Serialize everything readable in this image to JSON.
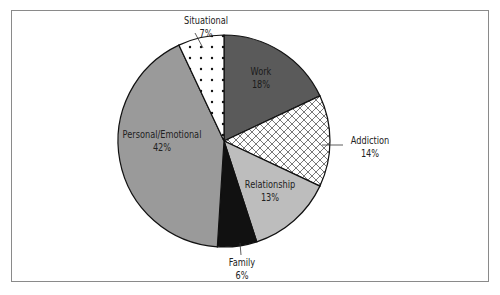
{
  "chart_data": {
    "type": "pie",
    "title": "",
    "slices": [
      {
        "label": "Work",
        "value": 18,
        "display": "18%",
        "fill": "#5a5a5a",
        "pattern": "solid"
      },
      {
        "label": "Addiction",
        "value": 14,
        "display": "14%",
        "fill": "#ffffff",
        "pattern": "crosshatch"
      },
      {
        "label": "Relationship",
        "value": 13,
        "display": "13%",
        "fill": "#bdbdbd",
        "pattern": "solid"
      },
      {
        "label": "Family",
        "value": 6,
        "display": "6%",
        "fill": "#111111",
        "pattern": "solid"
      },
      {
        "label": "Personal/Emotional",
        "value": 42,
        "display": "42%",
        "fill": "#9a9a9a",
        "pattern": "solid"
      },
      {
        "label": "Situational",
        "value": 7,
        "display": "7%",
        "fill": "#ffffff",
        "pattern": "dots"
      }
    ],
    "start_angle_deg": 0,
    "direction": "clockwise",
    "legend": "none",
    "labels_position": "inside/leader-lines"
  },
  "labels": {
    "work": {
      "name": "Work",
      "pct": "18%"
    },
    "addiction": {
      "name": "Addiction",
      "pct": "14%"
    },
    "relationship": {
      "name": "Relationship",
      "pct": "13%"
    },
    "family": {
      "name": "Family",
      "pct": "6%"
    },
    "personal": {
      "name": "Personal/Emotional",
      "pct": "42%"
    },
    "situational": {
      "name": "Situational",
      "pct": "7%"
    }
  }
}
